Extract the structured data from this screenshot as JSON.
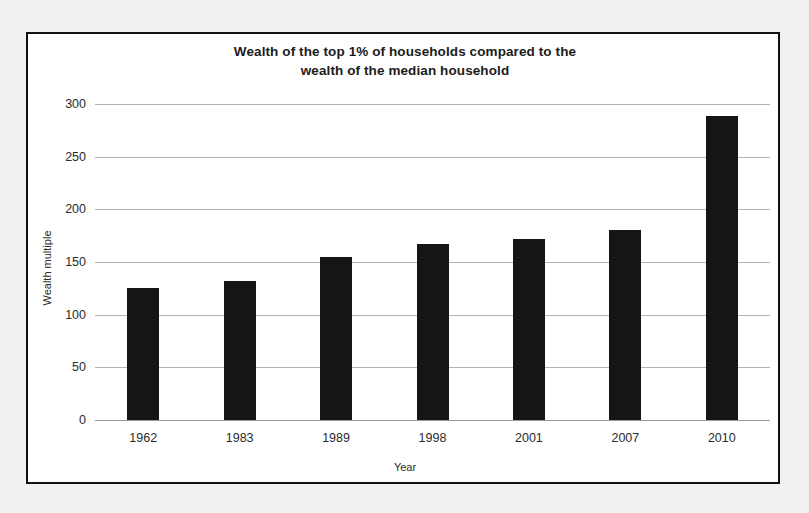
{
  "chart_data": {
    "type": "bar",
    "title": "Wealth of the top 1% of households compared to the wealth of the median household",
    "title_lines": [
      "Wealth of the top 1% of households compared to the",
      "wealth of the median household"
    ],
    "xlabel": "Year",
    "ylabel": "Wealth multiple",
    "categories": [
      "1962",
      "1983",
      "1989",
      "1998",
      "2001",
      "2007",
      "2010"
    ],
    "values": [
      125,
      132,
      154,
      167,
      172,
      180,
      288
    ],
    "ylim": [
      0,
      300
    ],
    "yticks": [
      0,
      50,
      100,
      150,
      200,
      250,
      300
    ],
    "ytick_labels": [
      "0",
      "50",
      "100",
      "150",
      "200",
      "250",
      "300"
    ],
    "grid": true,
    "legend": false,
    "bar_color": "#151515",
    "grid_color": "#b4b4b4",
    "background_color": "#ffffff",
    "frame_color": "#111111"
  }
}
